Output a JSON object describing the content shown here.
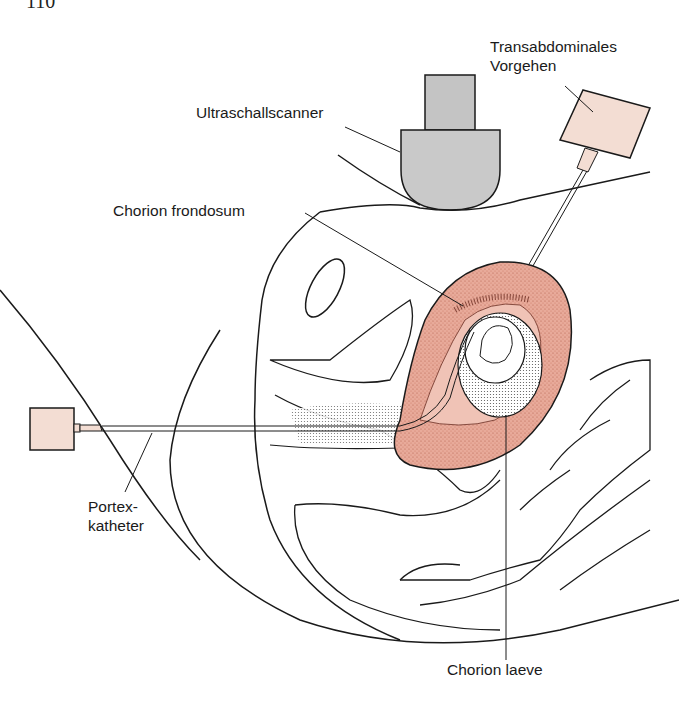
{
  "page": {
    "number": "110"
  },
  "labels": {
    "ultrasound": "Ultraschallscanner",
    "transabdominal_line1": "Transabdominales",
    "transabdominal_line2": "Vorgehen",
    "chorion_frondosum": "Chorion frondosum",
    "portex_line1": "Portex-",
    "portex_line2": "katheter",
    "chorion_laeve": "Chorion laeve"
  },
  "colors": {
    "uterus_fill": "#e8aa9a",
    "scanner_fill": "#c9c9c9",
    "syringe_fill": "#f3ddd3",
    "line": "#1a1a1a"
  }
}
